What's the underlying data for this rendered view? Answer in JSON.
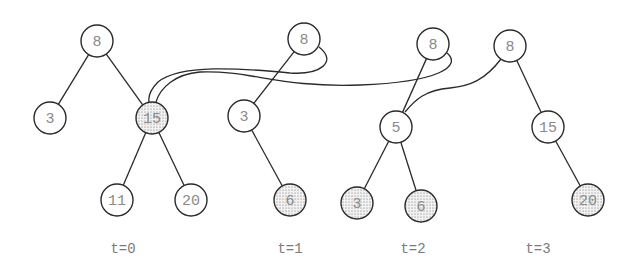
{
  "colors": {
    "stroke": "#2a2a2a",
    "label": "#8a8a8a",
    "fill_plain": "#ffffff",
    "fill_shaded": "dotted-gray"
  },
  "node_radius": 16,
  "trees": [
    {
      "version_label": "t=0",
      "label_pos": [
        123,
        249
      ],
      "nodes": [
        {
          "id": "t0-8",
          "key": "8",
          "x": 97,
          "y": 41,
          "shaded": false
        },
        {
          "id": "t0-3",
          "key": "3",
          "x": 50,
          "y": 118,
          "shaded": false
        },
        {
          "id": "t0-15",
          "key": "15",
          "x": 152,
          "y": 118,
          "shaded": true
        },
        {
          "id": "t0-11",
          "key": "11",
          "x": 117,
          "y": 200,
          "shaded": false
        },
        {
          "id": "t0-20",
          "key": "20",
          "x": 191,
          "y": 200,
          "shaded": false
        }
      ],
      "edges": [
        [
          "t0-8",
          "t0-3"
        ],
        [
          "t0-8",
          "t0-15"
        ],
        [
          "t0-15",
          "t0-11"
        ],
        [
          "t0-15",
          "t0-20"
        ]
      ]
    },
    {
      "version_label": "t=1",
      "label_pos": [
        290,
        249
      ],
      "nodes": [
        {
          "id": "t1-8",
          "key": "8",
          "x": 304,
          "y": 39,
          "shaded": false
        },
        {
          "id": "t1-3",
          "key": "3",
          "x": 244,
          "y": 116,
          "shaded": false
        },
        {
          "id": "t1-6",
          "key": "6",
          "x": 290,
          "y": 200,
          "shaded": true
        }
      ],
      "edges": [
        [
          "t1-8",
          "t1-3"
        ],
        [
          "t1-3",
          "t1-6"
        ]
      ]
    },
    {
      "version_label": "t=2",
      "label_pos": [
        413,
        249
      ],
      "nodes": [
        {
          "id": "t2-8",
          "key": "8",
          "x": 433,
          "y": 44,
          "shaded": false
        },
        {
          "id": "t2-5",
          "key": "5",
          "x": 396,
          "y": 127,
          "shaded": false
        },
        {
          "id": "t2-3",
          "key": "3",
          "x": 357,
          "y": 203,
          "shaded": true
        },
        {
          "id": "t2-6",
          "key": "6",
          "x": 421,
          "y": 206,
          "shaded": true
        }
      ],
      "edges": [
        [
          "t2-8",
          "t2-5"
        ],
        [
          "t2-5",
          "t2-3"
        ],
        [
          "t2-5",
          "t2-6"
        ]
      ]
    },
    {
      "version_label": "t=3",
      "label_pos": [
        538,
        249
      ],
      "nodes": [
        {
          "id": "t3-8",
          "key": "8",
          "x": 510,
          "y": 46,
          "shaded": false
        },
        {
          "id": "t3-15",
          "key": "15",
          "x": 548,
          "y": 127,
          "shaded": false
        },
        {
          "id": "t3-20",
          "key": "20",
          "x": 588,
          "y": 200,
          "shaded": true
        }
      ],
      "edges": [
        [
          "t3-8",
          "t3-15"
        ],
        [
          "t3-15",
          "t3-20"
        ]
      ]
    }
  ],
  "shared_links": [
    {
      "from": "t1-8",
      "to": "t0-15",
      "description": "t=1 root's right pointer shares node 15 from t=0",
      "path": "M 319 47 C 338 62, 320 75, 290 73 C 240 68, 180 64, 158 82 C 150 90, 148 96, 149 102"
    },
    {
      "from": "t2-8",
      "to": "t0-15",
      "description": "t=2 root's right pointer shares node 15 from t=0",
      "path": "M 447 53 C 462 66, 440 82, 360 85 C 280 88, 250 70, 200 72 C 175 74, 160 88, 156 102"
    },
    {
      "from": "t3-8",
      "to": "t2-5",
      "description": "t=3 root's left pointer shares node 5 from t=2",
      "path": "M 501 59 C 485 80, 470 86, 450 88 C 425 90, 415 100, 405 112"
    }
  ]
}
